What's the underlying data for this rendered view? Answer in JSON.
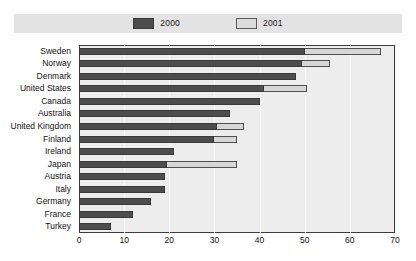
{
  "chart_data": {
    "type": "bar",
    "orientation": "horizontal",
    "title": "",
    "subtitle": "",
    "xlabel": "",
    "ylabel": "",
    "xlim": [
      0,
      70
    ],
    "xticks": [
      0,
      10,
      20,
      30,
      40,
      50,
      60,
      70
    ],
    "xtick_labels": [
      "0",
      "10",
      "20",
      "30",
      "40",
      "50",
      "60",
      "70"
    ],
    "grid": true,
    "grid_axis": "x",
    "legend_position": "top-center",
    "categories": [
      "Sweden",
      "Norway",
      "Denmark",
      "United States",
      "Canada",
      "Australia",
      "United Kingdom",
      "Finland",
      "Ireland",
      "Japan",
      "Austria",
      "Italy",
      "Germany",
      "France",
      "Turkey"
    ],
    "series": [
      {
        "name": "2000",
        "color": "#4d4d4d",
        "values": [
          50.0,
          49.5,
          48.0,
          41.0,
          40.0,
          33.5,
          30.5,
          30.0,
          21.0,
          19.5,
          19.0,
          19.0,
          16.0,
          12.0,
          7.0
        ]
      },
      {
        "name": "2001",
        "color": "#d6d6d6",
        "values": [
          67.0,
          55.5,
          48.0,
          50.5,
          40.0,
          33.5,
          36.5,
          35.0,
          21.0,
          35.0,
          19.0,
          19.0,
          16.0,
          12.0,
          7.0
        ]
      }
    ]
  },
  "legend": {
    "entries": [
      {
        "label": "2000",
        "swatch": "dark-gray-swatch"
      },
      {
        "label": "2001",
        "swatch": "light-gray-swatch"
      }
    ]
  },
  "colors": {
    "series_2000": "#4d4d4d",
    "series_2001": "#d6d6d6",
    "plot_background": "#ededed",
    "legend_band": "#e3e3e3",
    "page_background": "#ffffff",
    "axis_line": "#3c3c3c",
    "gridline": "#f7f7f7",
    "text": "#141414"
  }
}
